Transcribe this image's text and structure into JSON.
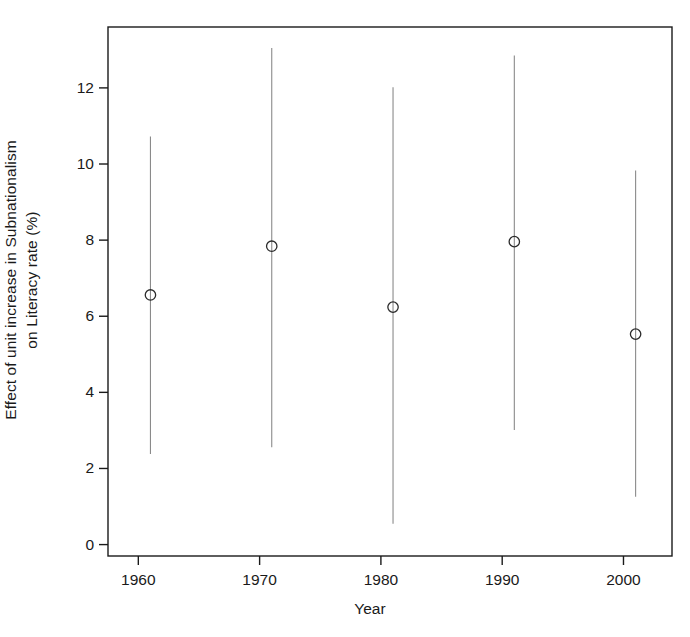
{
  "chart_data": {
    "type": "scatter",
    "title": "",
    "xlabel": "Year",
    "ylabel_line1": "Effect of unit increase in Subnationalism",
    "ylabel_line2": "on Literacy rate (%)",
    "ylabel": "Effect of unit increase in Subnationalism on Literacy rate (%)",
    "xlim": [
      1957.5,
      2004.0
    ],
    "ylim": [
      -0.3,
      13.6
    ],
    "grid": false,
    "legend": null,
    "xticks": [
      1960,
      1970,
      1980,
      1990,
      2000
    ],
    "xtick_labels": [
      "1960",
      "1970",
      "1980",
      "1990",
      "2000"
    ],
    "yticks": [
      0,
      2,
      4,
      6,
      8,
      10,
      12
    ],
    "ytick_labels": [
      "0",
      "2",
      "4",
      "6",
      "8",
      "10",
      "12"
    ],
    "marker": "open-circle",
    "errorbar_style": "vertical-line-no-caps",
    "series": [
      {
        "name": "Effect of Subnationalism on Literacy rate",
        "x": [
          1961,
          1971,
          1981,
          1991,
          2001
        ],
        "values": [
          6.56,
          7.84,
          6.24,
          7.96,
          5.53
        ],
        "ci_low": [
          2.38,
          2.56,
          0.55,
          3.01,
          1.26
        ],
        "ci_high": [
          10.72,
          13.05,
          12.02,
          12.85,
          9.83
        ]
      }
    ],
    "points": [
      {
        "year": 1961,
        "estimate": 6.56,
        "ci_low": 2.38,
        "ci_high": 10.72
      },
      {
        "year": 1971,
        "estimate": 7.84,
        "ci_low": 2.56,
        "ci_high": 13.05
      },
      {
        "year": 1981,
        "estimate": 6.24,
        "ci_low": 0.55,
        "ci_high": 12.02
      },
      {
        "year": 1991,
        "estimate": 7.96,
        "ci_low": 3.01,
        "ci_high": 12.85
      },
      {
        "year": 2001,
        "estimate": 5.53,
        "ci_low": 1.26,
        "ci_high": 9.83
      }
    ],
    "colors": {
      "axis": "#1a1a1a",
      "marker": "#2b2b2b",
      "errorbar": "#8a8a8a",
      "background": "#ffffff"
    }
  }
}
